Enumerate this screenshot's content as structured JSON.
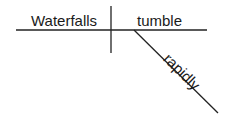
{
  "diagram": {
    "type": "sentence-diagram",
    "subject": "Waterfalls",
    "verb": "tumble",
    "modifier": "rapidly"
  }
}
